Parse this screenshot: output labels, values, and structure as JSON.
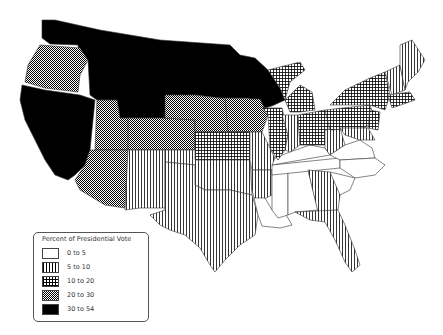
{
  "legend": {
    "title": "Percent of Presidential Vote",
    "items": [
      {
        "label": "0 to 5",
        "pattern": "white"
      },
      {
        "label": "5 to 10",
        "pattern": "vertical-lines"
      },
      {
        "label": "10 to 20",
        "pattern": "grid"
      },
      {
        "label": "20 to 30",
        "pattern": "checker"
      },
      {
        "label": "30 to 54",
        "pattern": "solid-black"
      }
    ]
  },
  "colors": {
    "ink": "#000000",
    "paper": "#ffffff",
    "border": "#555555"
  },
  "map": {
    "region": "Contiguous United States",
    "classes": {
      "30 to 54": [
        "WA",
        "CA",
        "NV",
        "ID",
        "MT",
        "WY-north",
        "ND",
        "SD",
        "MN",
        "WI"
      ],
      "20 to 30": [
        "OR",
        "UT",
        "AZ",
        "CO",
        "NE",
        "IA"
      ],
      "10 to 20": [
        "KS",
        "IL",
        "MI",
        "OH",
        "PA",
        "NY",
        "NJ",
        "MA",
        "CT"
      ],
      "5 to 10": [
        "NM",
        "TX",
        "OK",
        "MO",
        "AR",
        "IN",
        "WV",
        "VT",
        "NH",
        "ME",
        "MD",
        "GA",
        "FL"
      ],
      "0 to 5": [
        "LA",
        "MS",
        "AL",
        "TN",
        "KY",
        "VA",
        "NC",
        "SC"
      ]
    }
  }
}
